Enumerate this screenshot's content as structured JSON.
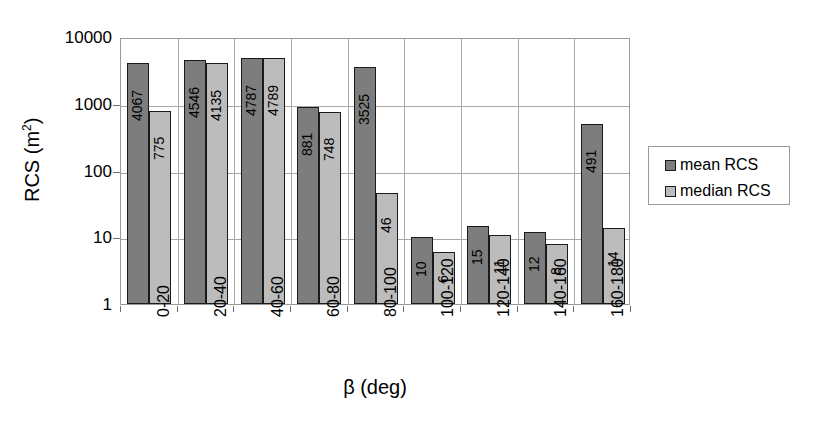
{
  "chart_data": {
    "type": "bar",
    "title": "",
    "subtitle": "",
    "xlabel": "β (deg)",
    "ylabel": "RCS (m²)",
    "ylabel_base": "RCS (m",
    "ylabel_sup": "2",
    "ylabel_close": ")",
    "yscale": "log",
    "ylim": [
      1,
      10000
    ],
    "ytick_labels": [
      "10000",
      "1000",
      "100",
      "10",
      "1"
    ],
    "ytick_values": [
      10000,
      1000,
      100,
      10,
      1
    ],
    "grid": "horizontal-and-vertical",
    "legend_position": "right",
    "categories": [
      "0-20",
      "20-40",
      "40-60",
      "60-80",
      "80-100",
      "100-120",
      "120-140",
      "140-160",
      "160-180"
    ],
    "series": [
      {
        "name": "mean RCS",
        "color": "#7d7d7d",
        "values": [
          4067,
          4546,
          4787,
          881,
          3525,
          10,
          15,
          12,
          491
        ]
      },
      {
        "name": "median RCS",
        "color": "#bcbcbc",
        "values": [
          775,
          4135,
          4789,
          748,
          46,
          6,
          11,
          8,
          14
        ]
      }
    ]
  },
  "legend": {
    "items": [
      {
        "label": "mean RCS",
        "swatch": "mean"
      },
      {
        "label": "median RCS",
        "swatch": "median"
      }
    ]
  },
  "colors": {
    "mean": "#7d7d7d",
    "median": "#bcbcbc",
    "grid": "#a8a8a8",
    "frame": "#9a9a9a",
    "bar_outline": "#1a1a1a",
    "background": "#ffffff"
  }
}
